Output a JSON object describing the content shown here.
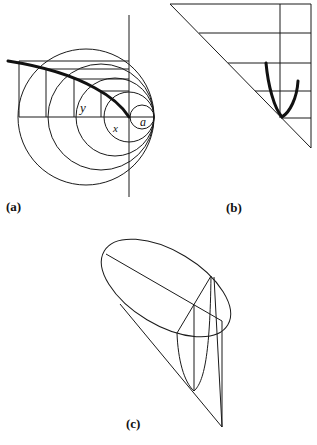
{
  "figure": {
    "panels": [
      {
        "id": "a",
        "label": "(a)",
        "variables": {
          "y": "y",
          "x": "x",
          "a": "a"
        },
        "description": "Family of circles tangent at a common point on a horizontal axis, with a vertical axis; rectangles inscribed and a thick curve through their corners"
      },
      {
        "id": "b",
        "label": "(b)",
        "description": "Right triangle with horizontal grid lines, a vertical line, and a thick parabola-like curve touching the hypotenuse"
      },
      {
        "id": "c",
        "label": "(c)",
        "description": "Oblique cone with elliptical section, diameter, and inner parabolic section"
      }
    ]
  }
}
